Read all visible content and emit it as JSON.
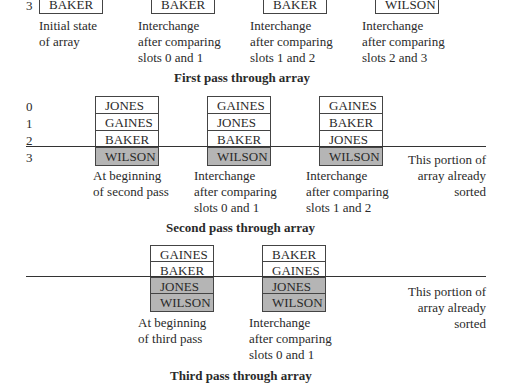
{
  "figure": {
    "pass1": {
      "title": "First pass through array",
      "index_label": "3",
      "states": [
        {
          "bottom_cell": "BAKER",
          "caption": "Initial state\nof array"
        },
        {
          "bottom_cell": "BAKER",
          "caption": "Interchange\nafter comparing\nslots 0 and 1"
        },
        {
          "bottom_cell": "BAKER",
          "caption": "Interchange\nafter comparing\nslots 1 and 2"
        },
        {
          "bottom_cell": "WILSON",
          "caption": "Interchange\nafter comparing\nslots 2 and 3"
        }
      ]
    },
    "pass2": {
      "title": "Second pass through array",
      "indices": [
        "0",
        "1",
        "2",
        "3"
      ],
      "states": [
        {
          "cells": [
            "JONES",
            "GAINES",
            "BAKER",
            "WILSON"
          ],
          "caption": "At beginning\nof second pass"
        },
        {
          "cells": [
            "GAINES",
            "JONES",
            "BAKER",
            "WILSON"
          ],
          "caption": "Interchange\nafter comparing\nslots 0 and 1"
        },
        {
          "cells": [
            "GAINES",
            "BAKER",
            "JONES",
            "WILSON"
          ],
          "caption": "Interchange\nafter comparing\nslots 1 and 2"
        }
      ],
      "sorted_note": "This portion of\narray already\nsorted"
    },
    "pass3": {
      "title": "Third pass through array",
      "states": [
        {
          "cells": [
            "GAINES",
            "BAKER",
            "JONES",
            "WILSON"
          ],
          "caption": "At beginning\nof third pass"
        },
        {
          "cells": [
            "BAKER",
            "GAINES",
            "JONES",
            "WILSON"
          ],
          "caption": "Interchange\nafter comparing\nslots 0 and 1"
        }
      ],
      "sorted_note": "This portion of\narray already\nsorted"
    },
    "colors": {
      "sorted_fill": "#b5b5b5",
      "border": "#444444"
    }
  }
}
